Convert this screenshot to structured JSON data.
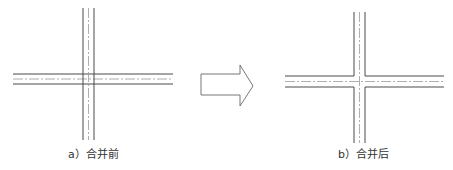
{
  "figure": {
    "panel_a": {
      "caption": "a）合并前"
    },
    "panel_b": {
      "caption": "b）合并后"
    },
    "arrow": {
      "direction": "right",
      "meaning": "merge-transformation"
    }
  },
  "colors": {
    "line": "#4a4a4a",
    "centerline": "#9a9a9a",
    "arrow_stroke": "#666666",
    "caption": "#333333",
    "background": "#ffffff"
  }
}
